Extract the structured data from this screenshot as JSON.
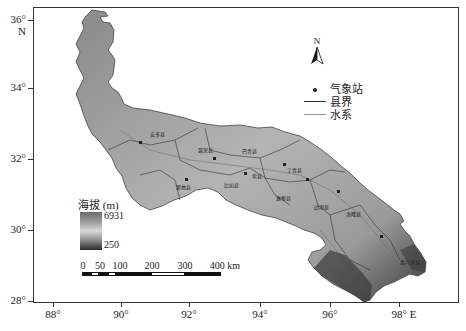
{
  "map": {
    "axes": {
      "y_ticks": [
        {
          "label": "36° N",
          "y": 20
        },
        {
          "label": "34°",
          "y": 88
        },
        {
          "label": "32°",
          "y": 159
        },
        {
          "label": "30°",
          "y": 230
        },
        {
          "label": "28°",
          "y": 301
        }
      ],
      "x_ticks": [
        {
          "label": "88°",
          "x": 53
        },
        {
          "label": "90°",
          "x": 121
        },
        {
          "label": "92°",
          "x": 189
        },
        {
          "label": "94°",
          "x": 260
        },
        {
          "label": "96°",
          "x": 330
        },
        {
          "label": "98° E",
          "x": 399
        }
      ]
    },
    "north_arrow": {
      "label": "N"
    },
    "legend": {
      "items": [
        {
          "symbol": "dot",
          "label": "气象站"
        },
        {
          "symbol": "dark-line",
          "label": "县界"
        },
        {
          "symbol": "light-line",
          "label": "水系"
        }
      ]
    },
    "elevation_legend": {
      "title": "海拔 (m)",
      "max": "6931",
      "min": "250"
    },
    "scale_bar": {
      "labels": [
        "0",
        "50",
        "100",
        "200",
        "300",
        "400 km"
      ]
    },
    "county_labels": [
      "安多县",
      "聂荣县",
      "巴青县",
      "丁青县",
      "索县",
      "那曲县",
      "比如县",
      "嘉黎县",
      "边坝县",
      "洛隆县",
      "类乌齐县",
      "察雅县"
    ]
  }
}
